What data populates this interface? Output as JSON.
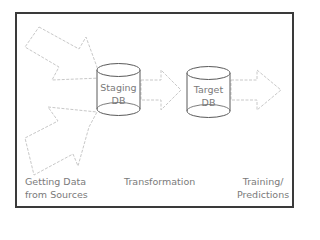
{
  "diagram": {
    "type": "pipeline",
    "frame": {
      "border_color": "#3a3a3a"
    },
    "arrow_color": "#c8c8c8",
    "cylinder_stroke": "#5a5a5a",
    "text_color": "#7a7a7a",
    "nodes": [
      {
        "id": "staging",
        "line1": "Staging",
        "line2": "DB"
      },
      {
        "id": "target",
        "line1": "Target",
        "line2": "DB"
      }
    ],
    "arrows": [
      {
        "id": "source-arrow-upper",
        "from": "sources",
        "to": "staging"
      },
      {
        "id": "source-arrow-lower",
        "from": "sources",
        "to": "staging"
      },
      {
        "id": "transform-arrow",
        "from": "staging",
        "to": "target"
      },
      {
        "id": "output-arrow",
        "from": "target",
        "to": "training"
      }
    ],
    "stages": [
      {
        "id": "sources",
        "line1": "Getting Data",
        "line2": "from Sources"
      },
      {
        "id": "transformation",
        "line1": "Transformation"
      },
      {
        "id": "training",
        "line1": "Training/",
        "line2": "Predictions"
      }
    ]
  }
}
